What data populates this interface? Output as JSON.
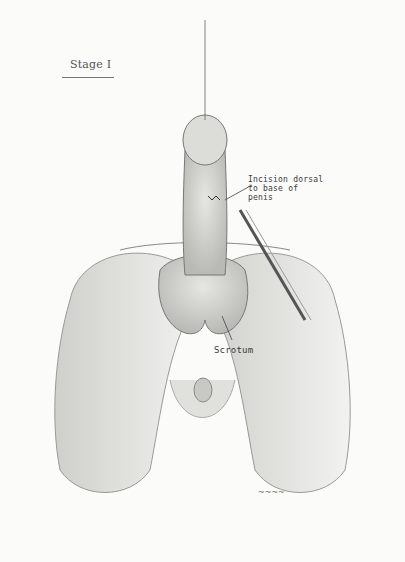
{
  "figure": {
    "title": "Stage I",
    "labels": {
      "incision": "Incision dorsal to base of penis",
      "scrotum": "Scrotum"
    },
    "signature": "signature (illegible)"
  }
}
